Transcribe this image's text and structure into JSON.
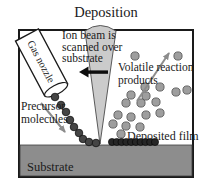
{
  "title": "Deposition",
  "labels": {
    "ion_beam_line1": "Ion beam is",
    "ion_beam_line2": "scanned over",
    "ion_beam_line3": "substrate",
    "volatile_line1": "Volatile reaction",
    "volatile_line2": "products",
    "precursor_line1": "Precursor",
    "precursor_line2": "molecules",
    "deposited_film": "Deposited film",
    "substrate": "Substrate",
    "gas_nozzle": "Gas nozzle"
  },
  "colors": {
    "beam_fill": "#cbcbcb",
    "beam_stroke": "#4a4a4a",
    "substrate_fill": "#8d8d8d",
    "volatile_dot_fill": "#9e9e9e",
    "precursor_dot_fill": "#454545",
    "film_dot_fill": "#262626",
    "black_arrow": "#0d0d0d",
    "gray_arrow": "#8c8c8c",
    "outline": "#1a1a1a"
  },
  "molecules": {
    "volatile": {
      "label": "volatile reaction product dots",
      "r": 4.1,
      "points": [
        [
          135,
          56
        ],
        [
          178,
          56
        ],
        [
          145,
          87
        ],
        [
          160,
          87
        ],
        [
          176,
          92
        ],
        [
          187,
          90
        ],
        [
          131,
          95
        ],
        [
          146,
          96
        ],
        [
          126,
          103
        ],
        [
          141,
          103
        ],
        [
          156,
          102
        ],
        [
          118,
          115
        ],
        [
          131,
          117
        ],
        [
          146,
          115
        ],
        [
          160,
          113
        ],
        [
          113,
          124
        ],
        [
          126,
          126
        ],
        [
          140,
          127
        ],
        [
          121,
          134
        ]
      ]
    },
    "precursor": {
      "label": "precursor molecule dots",
      "r": 3.8,
      "points": [
        [
          55,
          97
        ],
        [
          61,
          105
        ],
        [
          66,
          112
        ],
        [
          70,
          120
        ],
        [
          74,
          127
        ],
        [
          79,
          133
        ],
        [
          83,
          139
        ],
        [
          89,
          142
        ],
        [
          96,
          143
        ]
      ]
    },
    "film": {
      "label": "deposited film dot row",
      "r": 3.6,
      "y": 142,
      "x_start": 112,
      "x_end": 155,
      "count": 10
    }
  }
}
